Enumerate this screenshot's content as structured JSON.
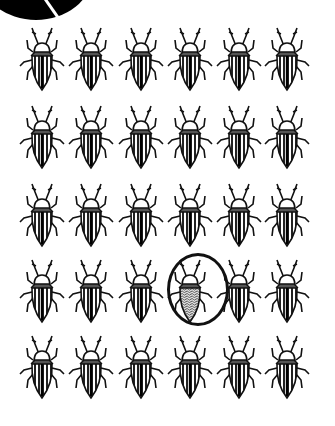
{
  "puzzle": {
    "type": "find-the-odd-one-out",
    "rows": 5,
    "columns": 6,
    "item": "beetle",
    "normal_pattern": "striped",
    "odd_pattern": "speckled",
    "odd_position": {
      "row": 4,
      "column": 4
    },
    "circled": true
  },
  "layout": {
    "column_centers_x": [
      42,
      91,
      141,
      190,
      239,
      287
    ],
    "row_tops_y": [
      26,
      104,
      182,
      258,
      334
    ],
    "ellipse": {
      "left": 167,
      "top": 253,
      "width": 62,
      "height": 73
    }
  },
  "colors": {
    "ink": "#111111",
    "background": "#ffffff"
  }
}
